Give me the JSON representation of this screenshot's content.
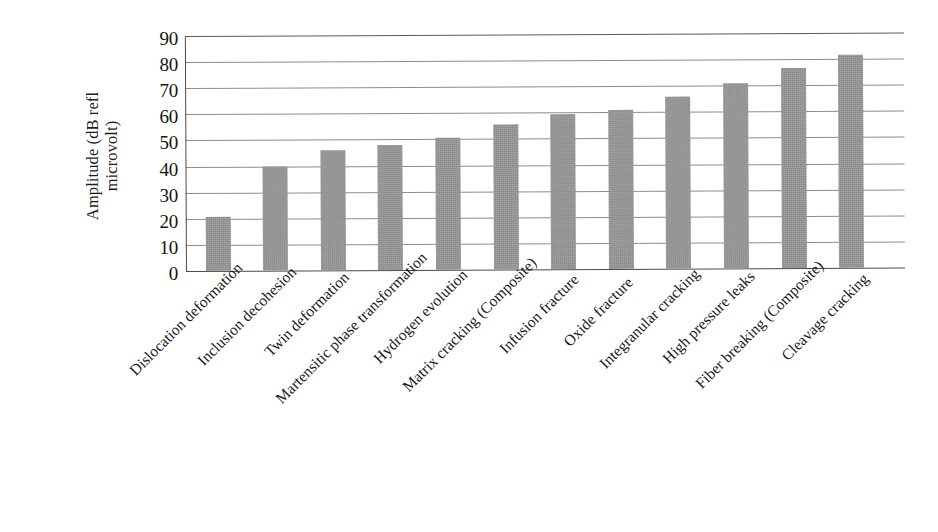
{
  "chart_data": {
    "type": "bar",
    "title": "",
    "xlabel": "",
    "ylabel_line1": "Amplitude (dB refl",
    "ylabel_line2": "microvolt)",
    "ylabel": "Amplitude (dB refl microvolt)",
    "ylim": [
      0,
      90
    ],
    "ytick_values": [
      0,
      10,
      20,
      30,
      40,
      50,
      60,
      70,
      80,
      90
    ],
    "ytick_labels": [
      "0",
      "10",
      "20",
      "30",
      "40",
      "50",
      "60",
      "70",
      "80",
      "90"
    ],
    "grid": true,
    "legend": "none",
    "bar_color": "#979797",
    "categories": [
      "Dislocation deformation",
      "Inclusion decohesion",
      "Twin deformation",
      "Martensitic phase transformation",
      "Hydrogen evolution",
      "Matrix cracking (Composite)",
      "Infusion fracture",
      "Oxide fracture",
      "Integranular cracking",
      "High pressure leaks",
      "Fiber breaking (Composite)",
      "Cleavage cracking"
    ],
    "values": [
      20.5,
      40,
      46,
      48,
      50.5,
      55.5,
      59.5,
      61,
      66,
      71,
      76.5,
      81.5
    ]
  }
}
